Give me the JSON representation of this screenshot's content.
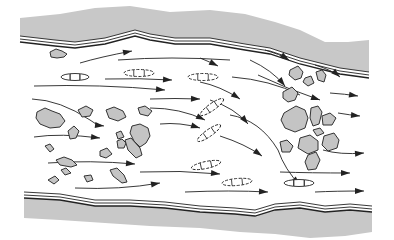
{
  "diagram": {
    "colors": {
      "bank_fill": "#c8c8c8",
      "bank_line": "#222222",
      "rock_fill": "#c4c4c4",
      "rock_stroke": "#333333",
      "arrow": "#222222",
      "water": "#ffffff"
    },
    "banks": {
      "top_outer": "M20,18 L60,14 L95,8 L130,6 L170,12 L210,10 L245,14 L275,22 L300,30 L325,42 L348,42 L369,40 L369,72 L340,68 L300,58 L270,48 L245,44 L210,38 L175,38 L150,34 L135,30 L105,38 L75,42 L55,40 L20,36 Z",
      "top_line1": "M20,36 L55,40 L75,42 L105,38 L135,30 L150,34 L175,38 L210,38 L245,44 L270,48 L300,58 L340,68 L369,72",
      "top_line2": "M20,39 L55,43 L75,45 L105,41 L135,33 L150,37 L175,41 L210,41 L245,47 L270,51 L300,61 L340,71 L369,75",
      "top_line3": "M20,42 L55,46 L75,48 L105,44 L135,36 L150,40 L175,44 L210,44 L245,50 L270,54 L300,64 L340,74 L369,78",
      "bottom_outer": "M24,198 L60,200 L95,206 L130,206 L165,208 L200,212 L235,214 L255,216 L275,210 L300,208 L325,212 L350,210 L372,212 L372,232 L345,236 L310,238 L275,234 L240,232 L200,228 L150,226 L120,224 L90,222 L60,220 L24,218 Z",
      "bottom_line1": "M24,192 L60,194 L95,200 L130,200 L165,202 L200,206 L235,208 L255,210 L275,204 L300,202 L325,206 L350,204 L372,206",
      "bottom_line2": "M24,195 L60,197 L95,203 L130,203 L165,205 L200,209 L235,211 L255,213 L275,207 L300,205 L325,209 L350,207 L372,209",
      "bottom_line3": "M24,198 L60,200 L95,206 L130,206 L165,208 L200,212 L235,214 L255,216 L275,210 L300,208 L325,212 L350,210 L372,212"
    },
    "rocks": [
      "M50,52 L56,49 L62,51 L67,54 L64,57 L57,58 L51,57 Z",
      "M37,112 L45,108 L52,111 L60,114 L65,121 L60,127 L50,128 L40,124 L36,118 Z",
      "M78,110 L86,106 L93,110 L90,116 L82,117 Z",
      "M106,110 L114,107 L123,111 L126,117 L118,121 L109,118 Z",
      "M68,131 L74,126 L79,131 L76,138 L70,139 Z",
      "M116,133 L121,131 L124,137 L118,139 Z",
      "M132,126 L140,124 L148,128 L150,136 L146,143 L140,147 L134,141 L130,133 Z",
      "M117,141 L122,139 L126,143 L124,148 L118,148 Z",
      "M138,108 L145,106 L152,111 L148,116 L140,114 Z",
      "M100,151 L107,148 L112,154 L106,158 L100,156 Z",
      "M125,140 L131,138 L140,148 L142,155 L136,158 L128,150 Z",
      "M45,146 L50,144 L54,149 L50,152 Z",
      "M56,160 L64,157 L72,160 L77,165 L71,167 L60,165 Z",
      "M61,170 L66,168 L71,173 L65,175 Z",
      "M48,180 L55,176 L59,180 L54,184 Z",
      "M84,176 L91,175 L93,180 L87,182 Z",
      "M110,170 L117,168 L124,175 L127,182 L122,183 L113,176 Z",
      "M290,70 L298,66 L303,72 L301,78 L295,80 L289,75 Z",
      "M305,78 L311,76 L314,83 L308,86 L303,82 Z",
      "M316,72 L322,70 L326,75 L324,82 L318,80 Z",
      "M283,92 L292,87 L298,93 L295,100 L288,102 L283,98 Z",
      "M284,113 L296,106 L305,110 L308,118 L305,128 L295,132 L285,128 L281,120 Z",
      "M311,108 L318,106 L322,112 L319,124 L313,126 L310,118 Z",
      "M322,116 L330,113 L336,118 L332,125 L323,125 Z",
      "M313,130 L320,128 L324,133 L317,136 Z",
      "M324,136 L334,133 L339,140 L337,148 L328,151 L322,145 Z",
      "M300,138 L310,135 L318,141 L318,150 L308,154 L298,148 Z",
      "M280,142 L287,140 L293,146 L290,152 L282,152 Z",
      "M308,155 L316,152 L320,160 L316,169 L308,170 L305,162 Z"
    ],
    "boats": [
      {
        "cx": 75,
        "cy": 77,
        "rx": 14,
        "ry": 3.5,
        "rot": 0,
        "style": "solid"
      },
      {
        "cx": 139,
        "cy": 73,
        "rx": 15,
        "ry": 3.5,
        "rot": 0,
        "style": "dashed"
      },
      {
        "cx": 203,
        "cy": 77,
        "rx": 15,
        "ry": 3.5,
        "rot": 0,
        "style": "dashed"
      },
      {
        "cx": 212,
        "cy": 107,
        "rx": 14,
        "ry": 3.5,
        "rot": -35,
        "style": "dashed"
      },
      {
        "cx": 209,
        "cy": 133,
        "rx": 14,
        "ry": 3.5,
        "rot": -35,
        "style": "dashed"
      },
      {
        "cx": 206,
        "cy": 165,
        "rx": 15,
        "ry": 3.5,
        "rot": -12,
        "style": "dashed"
      },
      {
        "cx": 237,
        "cy": 182,
        "rx": 15,
        "ry": 3.5,
        "rot": -5,
        "style": "dashed"
      },
      {
        "cx": 299,
        "cy": 183,
        "rx": 15,
        "ry": 3.5,
        "rot": 0,
        "style": "solid"
      }
    ],
    "flow_lines": [
      {
        "d": "M80,63 Q100,57 132,51",
        "arrow": [
          132,
          51
        ]
      },
      {
        "d": "M118,60 Q170,56 230,60",
        "arrow": []
      },
      {
        "d": "M200,58 Q210,62 218,66",
        "arrow": [
          218,
          66
        ]
      },
      {
        "d": "M105,79 Q140,78 172,80",
        "arrow": [
          172,
          80
        ]
      },
      {
        "d": "M34,86 Q100,84 165,90",
        "arrow": [
          165,
          90
        ]
      },
      {
        "d": "M150,99 Q175,98 200,99",
        "arrow": [
          200,
          99
        ]
      },
      {
        "d": "M32,99 Q60,100 90,120 Q95,125 104,126",
        "arrow": [
          104,
          126
        ]
      },
      {
        "d": "M34,137 Q60,133 100,138",
        "arrow": [
          100,
          138
        ]
      },
      {
        "d": "M48,163 Q90,160 135,164",
        "arrow": [
          135,
          164
        ]
      },
      {
        "d": "M75,188 Q120,190 160,183",
        "arrow": [
          160,
          183
        ]
      },
      {
        "d": "M150,108 Q180,108 205,120",
        "arrow": [
          205,
          120
        ]
      },
      {
        "d": "M160,124 Q180,122 200,128",
        "arrow": [
          200,
          128
        ]
      },
      {
        "d": "M140,172 Q180,170 220,174",
        "arrow": [
          220,
          174
        ]
      },
      {
        "d": "M185,192 Q230,190 268,192",
        "arrow": [
          268,
          192
        ]
      },
      {
        "d": "M200,82 Q220,86 240,99",
        "arrow": [
          240,
          99
        ]
      },
      {
        "d": "M210,100 Q235,108 248,124",
        "arrow": [
          248,
          124
        ]
      },
      {
        "d": "M220,136 Q245,144 262,156",
        "arrow": [
          262,
          156
        ]
      },
      {
        "d": "M230,115 Q260,120 278,150 Q285,170 300,185",
        "arrow": [
          300,
          185
        ]
      },
      {
        "d": "M265,50 Q280,54 289,60",
        "arrow": [
          289,
          60
        ]
      },
      {
        "d": "M250,60 Q272,70 285,86",
        "arrow": [
          285,
          86
        ]
      },
      {
        "d": "M258,75 Q290,90 320,100",
        "arrow": [
          320,
          100
        ]
      },
      {
        "d": "M232,77 Q270,80 300,95",
        "arrow": []
      },
      {
        "d": "M315,65 Q332,70 340,77",
        "arrow": [
          340,
          77
        ]
      },
      {
        "d": "M330,93 Q345,94 358,96",
        "arrow": [
          358,
          96
        ]
      },
      {
        "d": "M338,113 Q350,115 360,116",
        "arrow": [
          360,
          116
        ]
      },
      {
        "d": "M323,150 Q340,155 364,153",
        "arrow": [
          364,
          153
        ]
      },
      {
        "d": "M280,172 Q310,173 350,173",
        "arrow": [
          350,
          173
        ]
      },
      {
        "d": "M315,192 Q335,191 364,191",
        "arrow": [
          364,
          191
        ]
      }
    ]
  }
}
